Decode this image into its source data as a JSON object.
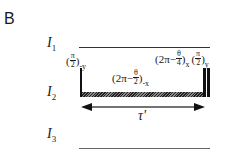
{
  "panel_label": "B",
  "levels": [
    {
      "symbol": "I",
      "subscript": "1"
    },
    {
      "symbol": "I",
      "subscript": "2"
    },
    {
      "symbol": "I",
      "subscript": "3"
    }
  ],
  "pulses": {
    "left": {
      "open": "(",
      "num": "π",
      "den": "2",
      "close": ")",
      "sub": "-y"
    },
    "middle": {
      "prefix": "(2π−",
      "num": "θ",
      "den": "2",
      "close": ")",
      "sub": "-x"
    },
    "right_a": {
      "prefix": "(2π−",
      "num": "θ",
      "den": "4",
      "close": ")",
      "sub": "x"
    },
    "right_b": {
      "open": "(",
      "num": "π",
      "den": "2",
      "close": ")",
      "sub": "y"
    }
  },
  "interval": {
    "label": "τ'"
  }
}
